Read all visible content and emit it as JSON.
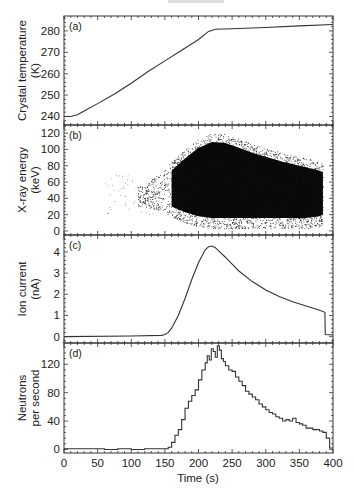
{
  "figure": {
    "header_fragment": "",
    "x_axis": {
      "label": "Time (s)",
      "ticks": [
        0,
        50,
        100,
        150,
        200,
        250,
        300,
        350,
        400
      ],
      "range": [
        0,
        400
      ]
    }
  },
  "chart_data": [
    {
      "panel": "(a)",
      "type": "line",
      "ylabel": [
        "Crystal temperature",
        "(K)"
      ],
      "xlabel": "Time (s)",
      "ylim": [
        236,
        287
      ],
      "yticks": [
        240,
        250,
        260,
        270,
        280
      ],
      "x": [
        0,
        10,
        20,
        30,
        50,
        75,
        100,
        125,
        150,
        175,
        200,
        215,
        225,
        250,
        300,
        350,
        400
      ],
      "values": [
        240,
        240,
        240.8,
        242.5,
        246,
        250.5,
        255.5,
        261,
        266,
        271,
        276,
        279.8,
        280.8,
        281,
        281.6,
        282.4,
        283
      ]
    },
    {
      "panel": "(b)",
      "type": "scatter",
      "ylabel": [
        "X-ray energy",
        "(keV)"
      ],
      "xlabel": "Time (s)",
      "ylim": [
        -5,
        130
      ],
      "yticks": [
        0,
        20,
        40,
        60,
        80,
        100,
        120
      ],
      "density_envelope": {
        "x": [
          120,
          140,
          150,
          160,
          180,
          200,
          220,
          240,
          260,
          280,
          300,
          320,
          340,
          360,
          380,
          385
        ],
        "upper": [
          50,
          65,
          72,
          80,
          95,
          108,
          115,
          114,
          108,
          102,
          97,
          92,
          88,
          84,
          80,
          78
        ],
        "lower": [
          35,
          30,
          28,
          22,
          15,
          10,
          8,
          8,
          8,
          8,
          8,
          8,
          8,
          8,
          10,
          12
        ],
        "dense_core_start": 160,
        "dense_core_end": 385
      }
    },
    {
      "panel": "(c)",
      "type": "line",
      "ylabel": [
        "Ion current",
        "(nA)"
      ],
      "xlabel": "Time (s)",
      "ylim": [
        -0.3,
        4.8
      ],
      "yticks": [
        0,
        1,
        2,
        3,
        4
      ],
      "x": [
        0,
        100,
        145,
        150,
        155,
        160,
        170,
        180,
        190,
        200,
        210,
        215,
        220,
        225,
        230,
        240,
        250,
        260,
        280,
        300,
        320,
        340,
        360,
        380,
        388,
        388.5,
        400
      ],
      "values": [
        0.0,
        0.03,
        0.06,
        0.1,
        0.2,
        0.4,
        1.0,
        1.8,
        2.7,
        3.5,
        4.1,
        4.25,
        4.28,
        4.2,
        4.05,
        3.75,
        3.42,
        3.1,
        2.6,
        2.2,
        1.9,
        1.65,
        1.45,
        1.25,
        1.15,
        0.1,
        0.08
      ]
    },
    {
      "panel": "(d)",
      "type": "line",
      "step": true,
      "ylabel": [
        "Neutrons",
        "per second"
      ],
      "xlabel": "Time (s)",
      "ylim": [
        -5,
        150
      ],
      "yticks": [
        0,
        40,
        80,
        120
      ],
      "x": [
        0,
        20,
        40,
        60,
        80,
        100,
        120,
        140,
        150,
        155,
        160,
        165,
        170,
        175,
        180,
        185,
        190,
        195,
        200,
        205,
        210,
        213,
        216,
        219,
        222,
        225,
        228,
        231,
        234,
        237,
        240,
        245,
        250,
        255,
        260,
        265,
        270,
        275,
        280,
        285,
        290,
        295,
        300,
        305,
        310,
        315,
        320,
        325,
        330,
        335,
        340,
        345,
        350,
        355,
        360,
        365,
        370,
        375,
        380,
        385,
        390,
        395
      ],
      "values": [
        1,
        1,
        1,
        0,
        1,
        0,
        1,
        1,
        1,
        3,
        10,
        20,
        28,
        42,
        58,
        68,
        76,
        84,
        98,
        112,
        122,
        132,
        126,
        142,
        138,
        130,
        146,
        140,
        128,
        124,
        118,
        112,
        110,
        102,
        96,
        90,
        82,
        78,
        74,
        70,
        64,
        60,
        56,
        52,
        50,
        46,
        44,
        40,
        42,
        40,
        44,
        38,
        36,
        34,
        30,
        30,
        28,
        28,
        26,
        24,
        16,
        2
      ]
    }
  ]
}
